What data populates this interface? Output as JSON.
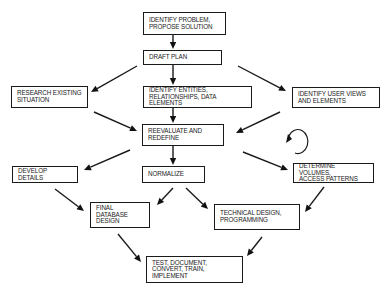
{
  "diagram": {
    "type": "flowchart",
    "title": "",
    "nodes": [
      {
        "id": "identify_problem",
        "label": "IDENTIFY PROBLEM,\nPROPOSE SOLUTION",
        "lines": [
          "IDENTIFY PROBLEM,",
          "PROPOSE SOLUTION"
        ],
        "box": [
          143,
          12,
          83,
          23
        ]
      },
      {
        "id": "draft_plan",
        "label": "DRAFT  PLAN",
        "lines": [
          "DRAFT  PLAN"
        ],
        "box": [
          143,
          50,
          79,
          15
        ]
      },
      {
        "id": "research_existing",
        "label": "RESEARCH EXISTING\nSITUATION",
        "lines": [
          "RESEARCH EXISTING",
          "SITUATION"
        ],
        "box": [
          11,
          86,
          77,
          22
        ]
      },
      {
        "id": "identify_entities",
        "label": "IDENTIFY ENTITIES,\nRELATIONSHIPS, DATA ELEMENTS",
        "lines": [
          "IDENTIFY ENTITIES,",
          "RELATIONSHIPS, DATA ELEMENTS"
        ],
        "box": [
          143,
          86,
          109,
          22
        ]
      },
      {
        "id": "identify_user_views",
        "label": "IDENTIFY USER VIEWS\nAND ELEMENTS",
        "lines": [
          "IDENTIFY USER VIEWS",
          "AND ELEMENTS"
        ],
        "box": [
          292,
          87,
          88,
          21
        ]
      },
      {
        "id": "reevaluate",
        "label": "REEVALUATE AND\nREDEFINE",
        "lines": [
          "REEVALUATE AND",
          "REDEFINE"
        ],
        "box": [
          142,
          124,
          82,
          22
        ]
      },
      {
        "id": "develop_details",
        "label": "DEVELOP DETAILS",
        "lines": [
          "DEVELOP DETAILS"
        ],
        "box": [
          12,
          166,
          66,
          17
        ]
      },
      {
        "id": "normalize",
        "label": "NORMALIZE",
        "lines": [
          "NORMALIZE"
        ],
        "box": [
          142,
          166,
          63,
          17
        ]
      },
      {
        "id": "determine_volumes",
        "label": "DETERMINE VOLUMES,\nACCESS PATTERNS",
        "lines": [
          "DETERMINE VOLUMES,",
          "ACCESS PATTERNS"
        ],
        "box": [
          293,
          163,
          81,
          20
        ]
      },
      {
        "id": "final_db_design",
        "label": "FINAL DATABASE\nDESIGN",
        "lines": [
          "FINAL DATABASE",
          "DESIGN"
        ],
        "box": [
          90,
          202,
          60,
          26
        ]
      },
      {
        "id": "technical_design",
        "label": "TECHNICAL DESIGN,\nPROGRAMMING",
        "lines": [
          "TECHNICAL DESIGN,",
          "PROGRAMMING"
        ],
        "box": [
          214,
          204,
          86,
          26
        ]
      },
      {
        "id": "test_implement",
        "label": "TEST, DOCUMENT,\nCONVERT, TRAIN, IMPLEMENT",
        "lines": [
          "TEST, DOCUMENT,",
          "CONVERT, TRAIN, IMPLEMENT"
        ],
        "box": [
          146,
          256,
          97,
          27
        ]
      }
    ],
    "edges": [
      {
        "from": "identify_problem",
        "to": "draft_plan",
        "points": [
          [
            173,
            35
          ],
          [
            173,
            49
          ]
        ]
      },
      {
        "from": "draft_plan",
        "to": "research_existing",
        "points": [
          [
            137,
            66
          ],
          [
            91,
            92
          ]
        ]
      },
      {
        "from": "draft_plan",
        "to": "identify_entities",
        "points": [
          [
            173,
            65
          ],
          [
            173,
            85
          ]
        ]
      },
      {
        "from": "draft_plan",
        "to": "identify_user_views",
        "points": [
          [
            238,
            66
          ],
          [
            286,
            91
          ]
        ]
      },
      {
        "from": "identify_entities",
        "to": "reevaluate",
        "points": [
          [
            173,
            108
          ],
          [
            173,
            123
          ]
        ]
      },
      {
        "from": "research_existing",
        "to": "reevaluate",
        "points": [
          [
            94,
            112
          ],
          [
            137,
            131
          ]
        ]
      },
      {
        "from": "identify_user_views",
        "to": "reevaluate",
        "points": [
          [
            280,
            112
          ],
          [
            236,
            133
          ]
        ]
      },
      {
        "from": "reevaluate",
        "to": "develop_details",
        "points": [
          [
            130,
            150
          ],
          [
            84,
            170
          ]
        ]
      },
      {
        "from": "reevaluate",
        "to": "normalize",
        "points": [
          [
            173,
            146
          ],
          [
            173,
            165
          ]
        ]
      },
      {
        "from": "reevaluate",
        "to": "determine_volumes",
        "points": [
          [
            243,
            152
          ],
          [
            288,
            170
          ]
        ]
      },
      {
        "from": "develop_details",
        "to": "final_db_design",
        "points": [
          [
            55,
            189
          ],
          [
            84,
            211
          ]
        ]
      },
      {
        "from": "normalize",
        "to": "final_db_design",
        "points": [
          [
            173,
            188
          ],
          [
            157,
            205
          ]
        ]
      },
      {
        "from": "normalize",
        "to": "technical_design",
        "points": [
          [
            186,
            188
          ],
          [
            208,
            209
          ]
        ]
      },
      {
        "from": "determine_volumes",
        "to": "technical_design",
        "points": [
          [
            324,
            187
          ],
          [
            305,
            212
          ]
        ]
      },
      {
        "from": "final_db_design",
        "to": "test_implement",
        "points": [
          [
            118,
            234
          ],
          [
            141,
            262
          ]
        ]
      },
      {
        "from": "technical_design",
        "to": "test_implement",
        "points": [
          [
            262,
            237
          ],
          [
            247,
            256
          ]
        ]
      }
    ],
    "self_loop": {
      "near": "determine_volumes",
      "center": [
        297,
        142
      ],
      "radius": 10
    }
  }
}
